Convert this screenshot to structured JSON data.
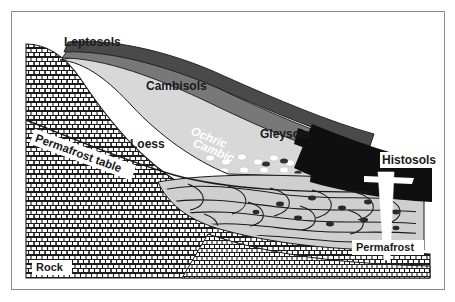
{
  "figure": {
    "type": "cross-section-diagram",
    "background_color": "#ffffff",
    "frame_color": "#8a8a8a"
  },
  "labels": {
    "leptosols": "Leptosols",
    "cambisols": "Cambisols",
    "gleysols": "Gleysols",
    "histosols": "Histosols",
    "loess": "Loess",
    "ochric": "Ochric",
    "cambic": "Cambic",
    "permafrost_table": "Permafrost table",
    "permafrost": "Permafrost",
    "rock": "Rock"
  },
  "units": [
    {
      "name": "Leptosols",
      "kind": "soil-unit",
      "position": "upper-slope",
      "color": "#ffffff"
    },
    {
      "name": "Cambisols",
      "kind": "soil-unit",
      "position": "mid-slope",
      "color": "#555555"
    },
    {
      "name": "Gleysols",
      "kind": "soil-unit",
      "position": "lower-slope",
      "color": "#2b2b2b"
    },
    {
      "name": "Histosols",
      "kind": "soil-unit",
      "position": "basin",
      "color": "#111111"
    },
    {
      "name": "Loess",
      "kind": "parent-material",
      "position": "slope-mantle",
      "color": "#d5d5d5"
    },
    {
      "name": "Rock",
      "kind": "bedrock",
      "position": "substrate",
      "color": "#ffffff"
    },
    {
      "name": "Permafrost",
      "kind": "frozen-ground",
      "position": "subsurface",
      "color": "#c9c9c9"
    }
  ],
  "horizons": [
    {
      "name": "Ochric",
      "color": "#4a4a4a",
      "description": "upper dark band"
    },
    {
      "name": "Cambic",
      "color": "#707070",
      "description": "lower gray band"
    }
  ],
  "features": [
    {
      "name": "permafrost-table",
      "type": "boundary-line"
    },
    {
      "name": "ice-wedge",
      "type": "white-vertical-wedge"
    },
    {
      "name": "clasts",
      "type": "dotted-stone-layer"
    },
    {
      "name": "cryoturbation",
      "type": "wavy-lenses"
    }
  ]
}
